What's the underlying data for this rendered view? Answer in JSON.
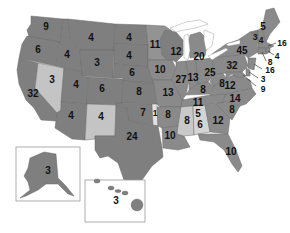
{
  "map": {
    "title": "US Electoral Votes by State",
    "colors": {
      "dark": "#7f7f7f",
      "medium": "#909090",
      "light": "#c9c9c9",
      "border": "#6a6a6a",
      "background": "#ffffff",
      "label": "#111111"
    },
    "states": {
      "WA": "9",
      "OR": "6",
      "CA": "32",
      "NV": "3",
      "ID": "4",
      "MT": "4",
      "WY": "3",
      "UT": "4",
      "AZ": "4",
      "CO": "6",
      "NM": "4",
      "ND": "4",
      "SD": "4",
      "NE": "6",
      "KS": "8",
      "OK": "7",
      "OK_STRIP": "1",
      "TX": "24",
      "MN": "11",
      "IA": "10",
      "MO": "13",
      "AR": "8",
      "LA": "10",
      "WI": "12",
      "IL": "27",
      "MI": "20",
      "IN": "13",
      "OH": "25",
      "KY": "8",
      "TN": "11",
      "MS": "8",
      "AL": "9",
      "AL_LABEL": "6",
      "MS_LABEL": "8",
      "TN_LABEL": "11",
      "GA": "12",
      "FL": "10",
      "SC": "8",
      "NC": "14",
      "VA": "12",
      "WV": "5",
      "PA": "32",
      "NY": "45",
      "VT": "3",
      "NH": "4",
      "ME": "5",
      "MA": "16",
      "RI": "4",
      "CT": "8",
      "NJ": "16",
      "DE": "3",
      "MD": "9",
      "AK": "3",
      "HI": "3"
    },
    "insets": [
      {
        "name": "Alaska",
        "value": "3"
      },
      {
        "name": "Hawaii",
        "value": "3"
      }
    ]
  }
}
